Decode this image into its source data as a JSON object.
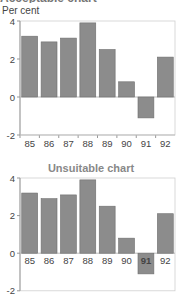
{
  "page": {
    "unit_label": "Per cent",
    "clipped_title": "Acceptable chart"
  },
  "chart_data": [
    {
      "type": "bar",
      "title": "",
      "ylabel": "Per cent",
      "xlabel": "",
      "categories": [
        "85",
        "86",
        "87",
        "88",
        "89",
        "90",
        "91",
        "92"
      ],
      "values": [
        3.2,
        2.9,
        3.1,
        3.9,
        2.5,
        0.8,
        -1.1,
        2.1
      ],
      "ylim": [
        -2,
        4
      ],
      "yticks": [
        "4",
        "2",
        "0",
        "-2"
      ],
      "x_labels_position": "bottom",
      "bar_color": "#8c8c8c",
      "grid": false
    },
    {
      "type": "bar",
      "title": "Unsuitable chart",
      "ylabel": "",
      "xlabel": "",
      "categories": [
        "85",
        "86",
        "87",
        "88",
        "89",
        "90",
        "91",
        "92"
      ],
      "values": [
        3.2,
        2.9,
        3.1,
        3.9,
        2.5,
        0.8,
        -1.1,
        2.1
      ],
      "ylim": [
        -2,
        4
      ],
      "yticks": [
        "4",
        "2",
        "0",
        "-2"
      ],
      "x_labels_position": "at zero line (overlapping negative bar)",
      "bar_color": "#8c8c8c",
      "grid": false
    }
  ]
}
